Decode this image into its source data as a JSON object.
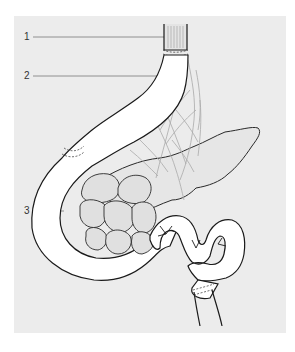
{
  "figure": {
    "panel_color": "#ececec",
    "outline_color": "#1a1a1a",
    "vessel_color": "#a8a8a8",
    "leader_color": "#777777",
    "labels": [
      {
        "number": "1",
        "x": 24,
        "y": 32,
        "target": "esophagus"
      },
      {
        "number": "2",
        "x": 24,
        "y": 71,
        "target": "stomach"
      },
      {
        "number": "3",
        "x": 24,
        "y": 206,
        "target": "duodenum"
      }
    ]
  }
}
